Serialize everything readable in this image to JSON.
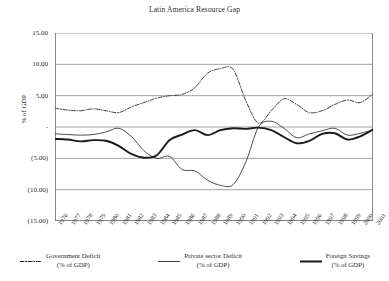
{
  "chart_data": {
    "type": "line",
    "title": "Latin America Resource Gap",
    "xlabel": "",
    "ylabel": "% of GDP",
    "ylim": [
      -15,
      15
    ],
    "ytick_labels": [
      "15.00",
      "10.00",
      "5.00",
      "-",
      "(5.00)",
      "(10.00)",
      "(15.00)"
    ],
    "ytick_values": [
      15,
      10,
      5,
      0,
      -5,
      -10,
      -15
    ],
    "grid": true,
    "legend_position": "bottom",
    "categories": [
      "1976",
      "1977",
      "1978",
      "1979",
      "1980",
      "1981",
      "1982",
      "1983",
      "1984",
      "1985",
      "1986",
      "1987",
      "1988",
      "1989",
      "1990",
      "1991",
      "1992",
      "1993",
      "1994",
      "1995",
      "1996",
      "1997",
      "1998",
      "1999",
      "2000",
      "2001"
    ],
    "series": [
      {
        "name": "Government Deficit",
        "unit": "(% of GDP)",
        "style": "dash-dot",
        "color": "#3d3d3d",
        "values": [
          3.0,
          2.7,
          2.6,
          2.9,
          2.6,
          2.3,
          3.2,
          3.9,
          4.6,
          5.0,
          5.2,
          6.3,
          8.6,
          9.3,
          9.2,
          4.2,
          0.6,
          2.6,
          4.5,
          3.6,
          2.3,
          2.6,
          3.6,
          4.3,
          3.9,
          5.3
        ]
      },
      {
        "name": "Private sector Deficit",
        "unit": "(% of GDP)",
        "style": "thin-solid",
        "color": "#2b2b2b",
        "values": [
          -1.1,
          -1.2,
          -1.3,
          -1.2,
          -0.8,
          -0.2,
          -1.5,
          -3.8,
          -5.0,
          -4.7,
          -6.8,
          -7.0,
          -8.5,
          -9.3,
          -9.2,
          -5.6,
          0.0,
          0.9,
          -0.2,
          -1.7,
          -1.1,
          -0.6,
          -0.2,
          -1.3,
          -1.0,
          -0.5
        ]
      },
      {
        "name": "Foreign Savings",
        "unit": "(% of GDP)",
        "style": "thick-solid",
        "color": "#1a1a1a",
        "values": [
          -1.9,
          -2.0,
          -2.3,
          -2.1,
          -2.2,
          -3.0,
          -4.3,
          -4.9,
          -4.5,
          -2.1,
          -1.2,
          -0.5,
          -1.3,
          -0.5,
          -0.2,
          -0.3,
          -0.1,
          -0.5,
          -1.6,
          -2.6,
          -2.2,
          -1.1,
          -1.0,
          -2.0,
          -1.5,
          -0.4
        ]
      }
    ]
  },
  "legend": [
    {
      "label": "Government Deficit",
      "sub": "(% of GDP)",
      "style": "dash-dot"
    },
    {
      "label": "Private sector Deficit",
      "sub": "(% of GDP)",
      "style": "thin-solid"
    },
    {
      "label": "Foreign Savings",
      "sub": "(% of GDP)",
      "style": "thick-solid"
    }
  ]
}
